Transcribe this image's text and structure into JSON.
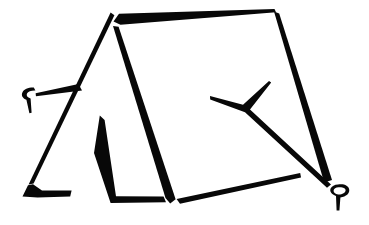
{
  "image": {
    "title": "Camping Tent Line Art",
    "subject": "camping-tent",
    "style": "black-and-white clip art silhouette outline",
    "background_color": "#ffffff",
    "ink_color": "#080808",
    "width": 369,
    "height": 225
  },
  "parts": [
    {
      "id": "ridge-line",
      "label": "Ridge pole line",
      "description": "Long tapering bar running from the tent apex up-right to the rear top corner"
    },
    {
      "id": "left-roof-edge",
      "label": "Left front roof edge",
      "description": "Tapering line from apex down-left to the ground at the left"
    },
    {
      "id": "front-face-edge",
      "label": "Front face edge",
      "description": "Tapering line from apex down to the bottom of the front panel"
    },
    {
      "id": "left-panel",
      "label": "Left side panel outline",
      "description": "Closed V-shaped band forming the left ground panel"
    },
    {
      "id": "door-flap",
      "label": "Door flap outline",
      "description": "Inner inverted-V shape forming the tent entrance flap"
    },
    {
      "id": "bottom-edge",
      "label": "Ground bottom edge",
      "description": "Tapering line along the ground from the front panel to the right"
    },
    {
      "id": "rear-edge",
      "label": "Rear right edge",
      "description": "Thick tapering line from the rear top corner down to the right ground"
    },
    {
      "id": "guy-line-left",
      "label": "Left guy rope",
      "description": "Thin tapering rope from the left roof edge to the left stake"
    },
    {
      "id": "guy-line-right",
      "label": "Right guy rope",
      "description": "Y-shaped tapering rope from the roof running down-right to the right stake"
    },
    {
      "id": "stake-left",
      "label": "Left tent stake",
      "description": "Hook-shaped peg at the left end of the left guy rope"
    },
    {
      "id": "stake-right",
      "label": "Right tent stake",
      "description": "Hook-shaped peg at the lower right end of the right guy rope"
    }
  ]
}
